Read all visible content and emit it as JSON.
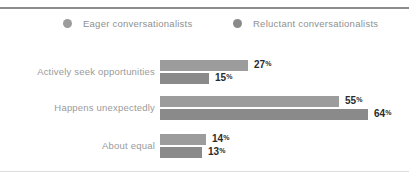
{
  "title_sliver": " ",
  "colors": {
    "series_eager": "#9c9c9c",
    "series_reluctant": "#8a8a8a",
    "label_text": "#9a9a9a",
    "value_text": "#2b2b2b",
    "top_rule": "#8c8c8c",
    "bottom_rule": "#dddddd",
    "background": "#ffffff"
  },
  "legend": {
    "items": [
      {
        "label": "Eager conversationalists",
        "color": "#9c9c9c",
        "icon": "circle-marker-icon"
      },
      {
        "label": "Reluctant conversationalists",
        "color": "#8a8a8a",
        "icon": "circle-marker-icon"
      }
    ]
  },
  "chart_data": {
    "type": "bar",
    "orientation": "horizontal",
    "title": "",
    "xlabel": "",
    "ylabel": "",
    "grid": false,
    "legend_position": "top",
    "xlim": [
      0,
      64
    ],
    "value_suffix": "%",
    "categories": [
      "Actively seek opportunities",
      "Happens unexpectedly",
      "About equal"
    ],
    "series": [
      {
        "name": "Eager conversationalists",
        "color": "#9c9c9c",
        "values": [
          27,
          55,
          14
        ],
        "labels": [
          "27",
          "55",
          "14"
        ]
      },
      {
        "name": "Reluctant conversationalists",
        "color": "#8a8a8a",
        "values": [
          15,
          64,
          13
        ],
        "labels": [
          "15",
          "64",
          "13"
        ]
      }
    ]
  }
}
